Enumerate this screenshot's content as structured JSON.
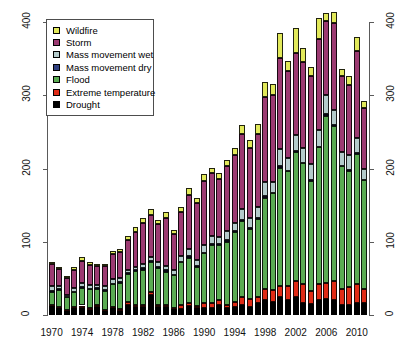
{
  "chart_data": {
    "type": "bar",
    "subtype": "stacked",
    "title": "",
    "xlabel": "",
    "ylabel": "",
    "xlim": [
      1969.4,
      2011.6
    ],
    "ylim": [
      0,
      400
    ],
    "yticks": [
      0,
      100,
      200,
      300,
      400
    ],
    "ytick_labels": [
      "0",
      "100",
      "200",
      "300",
      "400"
    ],
    "xticks": [
      1970,
      1974,
      1978,
      1982,
      1986,
      1990,
      1994,
      1998,
      2002,
      2006,
      2010
    ],
    "xtick_labels": [
      "1970",
      "1974",
      "1978",
      "1982",
      "1986",
      "1990",
      "1994",
      "1998",
      "2002",
      "2006",
      "2010"
    ],
    "grid": false,
    "right_axis": true,
    "right_yticks": [
      0,
      100,
      200,
      300,
      400
    ],
    "right_ytick_labels": [
      "0",
      "100",
      "200",
      "300",
      "400"
    ],
    "legend_position": "top-left",
    "categories": [
      1970,
      1971,
      1972,
      1973,
      1974,
      1975,
      1976,
      1977,
      1978,
      1979,
      1980,
      1981,
      1982,
      1983,
      1984,
      1985,
      1986,
      1987,
      1988,
      1989,
      1990,
      1991,
      1992,
      1993,
      1994,
      1995,
      1996,
      1997,
      1998,
      1999,
      2000,
      2001,
      2002,
      2003,
      2004,
      2005,
      2006,
      2007,
      2008,
      2009,
      2010,
      2011
    ],
    "series": [
      {
        "name": "Drought",
        "color": "#000000",
        "values": [
          12,
          10,
          6,
          9,
          10,
          7,
          11,
          6,
          9,
          6,
          14,
          11,
          11,
          28,
          11,
          11,
          8,
          8,
          12,
          9,
          10,
          9,
          13,
          9,
          11,
          14,
          11,
          16,
          20,
          18,
          25,
          20,
          25,
          17,
          15,
          21,
          22,
          20,
          13,
          14,
          17,
          16
        ]
      },
      {
        "name": "Extreme temperature",
        "color": "#e02b16",
        "values": [
          1,
          1,
          1,
          2,
          3,
          2,
          2,
          1,
          2,
          2,
          4,
          3,
          2,
          3,
          2,
          3,
          2,
          6,
          4,
          3,
          6,
          8,
          7,
          5,
          7,
          10,
          11,
          9,
          16,
          16,
          14,
          20,
          21,
          26,
          18,
          22,
          22,
          26,
          22,
          24,
          25,
          20
        ]
      },
      {
        "name": "Flood",
        "color": "#5aab52",
        "values": [
          19,
          23,
          18,
          20,
          24,
          27,
          23,
          26,
          32,
          36,
          38,
          46,
          49,
          42,
          51,
          45,
          44,
          58,
          62,
          54,
          68,
          78,
          76,
          86,
          96,
          104,
          96,
          106,
          124,
          132,
          162,
          156,
          176,
          164,
          150,
          186,
          228,
          212,
          168,
          158,
          178,
          148
        ]
      },
      {
        "name": "Mass movement dry",
        "color": "#2f3f7f",
        "values": [
          1,
          1,
          0,
          1,
          1,
          0,
          1,
          1,
          0,
          1,
          1,
          1,
          2,
          1,
          1,
          2,
          1,
          1,
          2,
          1,
          1,
          2,
          1,
          2,
          1,
          2,
          1,
          2,
          2,
          1,
          2,
          1,
          2,
          1,
          2,
          1,
          2,
          1,
          1,
          2,
          1,
          1
        ]
      },
      {
        "name": "Mass movement wet",
        "color": "#b4cbcb",
        "values": [
          6,
          4,
          3,
          5,
          6,
          5,
          4,
          5,
          6,
          5,
          5,
          5,
          6,
          5,
          7,
          6,
          6,
          7,
          10,
          8,
          10,
          11,
          9,
          13,
          11,
          15,
          13,
          14,
          20,
          15,
          24,
          18,
          22,
          20,
          21,
          23,
          26,
          21,
          18,
          20,
          21,
          14
        ]
      },
      {
        "name": "Storm",
        "color": "#9c3a72",
        "values": [
          30,
          24,
          22,
          25,
          30,
          27,
          26,
          28,
          34,
          36,
          40,
          48,
          56,
          57,
          52,
          66,
          50,
          60,
          74,
          78,
          88,
          86,
          80,
          88,
          92,
          102,
          96,
          100,
          116,
          118,
          124,
          118,
          112,
          118,
          120,
          124,
          102,
          118,
          104,
          96,
          118,
          84
        ]
      },
      {
        "name": "Wildfire",
        "color": "#e2e95a",
        "values": [
          4,
          2,
          2,
          3,
          5,
          4,
          3,
          3,
          5,
          4,
          6,
          6,
          7,
          9,
          6,
          8,
          5,
          7,
          9,
          7,
          9,
          7,
          8,
          9,
          10,
          13,
          11,
          14,
          20,
          16,
          34,
          14,
          34,
          19,
          12,
          28,
          10,
          16,
          10,
          12,
          20,
          9
        ]
      }
    ]
  },
  "legend": {
    "items": [
      {
        "label": "Wildfire",
        "color": "#e2e95a"
      },
      {
        "label": "Storm",
        "color": "#9c3a72"
      },
      {
        "label": "Mass movement wet",
        "color": "#b4cbcb"
      },
      {
        "label": "Mass movement dry",
        "color": "#2f3f7f"
      },
      {
        "label": "Flood",
        "color": "#5aab52"
      },
      {
        "label": "Extreme temperature",
        "color": "#e02b16"
      },
      {
        "label": "Drought",
        "color": "#000000"
      }
    ]
  }
}
